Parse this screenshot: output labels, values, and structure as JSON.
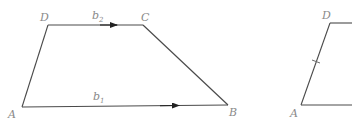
{
  "figures": [
    {
      "name": "trapezoid-vectors",
      "vertices": {
        "A": {
          "label": "A",
          "x": 22,
          "y": 107
        },
        "B": {
          "label": "B",
          "x": 228,
          "y": 105
        },
        "C": {
          "label": "C",
          "x": 143,
          "y": 25
        },
        "D": {
          "label": "D",
          "x": 48,
          "y": 25
        }
      },
      "vectors": [
        {
          "from": "D",
          "to": "C",
          "label": "b",
          "subscript": "2"
        },
        {
          "from": "A",
          "to": "B",
          "label": "b",
          "subscript": "1"
        }
      ]
    },
    {
      "name": "trapezoid-partial",
      "vertices": {
        "A": {
          "label": "A",
          "x": 301,
          "y": 105
        },
        "D": {
          "label": "D",
          "x": 330,
          "y": 23
        }
      },
      "tick_mark_on": "AD"
    }
  ],
  "colors": {
    "edge": "#4a4a4a",
    "label": "#8a8a8a",
    "arrow": "#222222"
  }
}
